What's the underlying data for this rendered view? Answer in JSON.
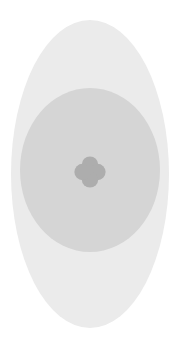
{
  "canvas": {
    "width": 181,
    "height": 346,
    "background_color": "#ffffff",
    "title": "Clover Badge Graphic"
  },
  "graphic": {
    "name": "clover-badge",
    "description": "Concentric pale grey oval with a grey circle and a four-petal clover glyph at its centre",
    "layers": [
      {
        "name": "outer-ellipse",
        "shape": "ellipse",
        "center_x": 90,
        "center_y": 174,
        "radius_x": 79,
        "radius_y": 154,
        "fill": "#ebebeb"
      },
      {
        "name": "inner-circle",
        "shape": "ellipse",
        "center_x": 90,
        "center_y": 170,
        "radius_x": 70,
        "radius_y": 82,
        "fill": "#d5d5d5"
      },
      {
        "name": "clover-icon",
        "shape": "four-petal-clover",
        "center_x": 90,
        "center_y": 172,
        "petal_radius": 8.2,
        "petal_offset": 7.4,
        "fill": "#adadad"
      }
    ]
  },
  "colors": {
    "background": "#ffffff",
    "outer_ellipse": "#ebebeb",
    "inner_circle": "#d5d5d5",
    "clover": "#adadad"
  },
  "labels": {
    "alt_text": "Pale grey oval badge with a four-petal clover symbol"
  }
}
